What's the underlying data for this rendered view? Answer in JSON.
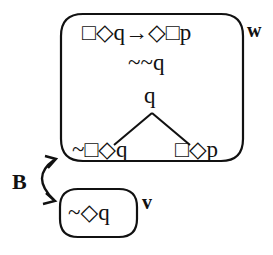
{
  "worlds": {
    "w": {
      "label": "w",
      "formulas": [
        "□◇q→◇□p",
        "~~q",
        "q"
      ],
      "branches": [
        "~□◇q",
        "□◇p"
      ]
    },
    "v": {
      "label": "v",
      "formulas": [
        "~◇q"
      ]
    }
  },
  "relation": {
    "label": "B",
    "from": "w",
    "to": "v",
    "direction": "bidirectional"
  }
}
